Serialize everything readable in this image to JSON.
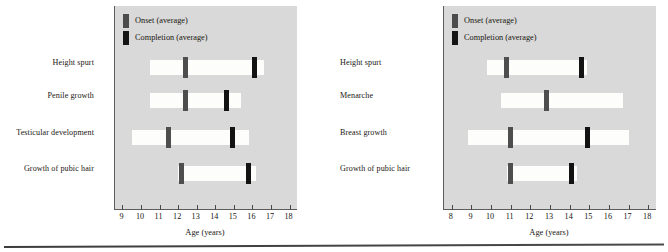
{
  "figure": {
    "bottom_rule": true
  },
  "legend": {
    "onset_label": "Onset (average)",
    "completion_label": "Completion (average)",
    "onset_color": "#4e4e4e",
    "completion_color": "#131313"
  },
  "panels": [
    {
      "id": "male",
      "axis_title": "Age (years)",
      "ticks": [
        9,
        10,
        11,
        12,
        13,
        14,
        15,
        16,
        17,
        18
      ],
      "rows": [
        {
          "label": "Height spurt"
        },
        {
          "label": "Penile growth"
        },
        {
          "label": "Testicular development"
        },
        {
          "label": "Growth of pubic hair"
        }
      ]
    },
    {
      "id": "female",
      "axis_title": "Age (years)",
      "ticks": [
        8,
        9,
        10,
        11,
        12,
        13,
        14,
        15,
        16,
        17,
        18
      ],
      "rows": [
        {
          "label": "Height spurt"
        },
        {
          "label": "Menarche"
        },
        {
          "label": "Breast growth"
        },
        {
          "label": "Growth of pubic hair"
        }
      ]
    }
  ],
  "chart_data": {
    "type": "bar",
    "title": "",
    "xlabel": "Age (years)",
    "ylabel": "",
    "grid": false,
    "legend_position": "top-left",
    "charts": [
      {
        "name": "Male pubertal development",
        "xlim": [
          8.6,
          18.4
        ],
        "xticks": [
          9,
          10,
          11,
          12,
          13,
          14,
          15,
          16,
          17,
          18
        ],
        "categories": [
          "Height spurt",
          "Penile growth",
          "Testicular development",
          "Growth of pubic hair"
        ],
        "ranges": [
          {
            "category": "Height spurt",
            "start": 10.5,
            "end": 16.6,
            "onset": 12.4,
            "completion": 16.1
          },
          {
            "category": "Penile growth",
            "start": 10.5,
            "end": 15.4,
            "onset": 12.4,
            "completion": 14.6
          },
          {
            "category": "Testicular development",
            "start": 9.5,
            "end": 15.8,
            "onset": 11.5,
            "completion": 14.9
          },
          {
            "category": "Growth of pubic hair",
            "start": 12.0,
            "end": 16.2,
            "onset": 12.2,
            "completion": 15.8
          }
        ]
      },
      {
        "name": "Female pubertal development",
        "xlim": [
          7.6,
          18.4
        ],
        "xticks": [
          8,
          9,
          10,
          11,
          12,
          13,
          14,
          15,
          16,
          17,
          18
        ],
        "categories": [
          "Height spurt",
          "Menarche",
          "Breast growth",
          "Growth of pubic hair"
        ],
        "ranges": [
          {
            "category": "Height spurt",
            "start": 9.8,
            "end": 14.9,
            "onset": 10.8,
            "completion": 14.6
          },
          {
            "category": "Menarche",
            "start": 10.5,
            "end": 16.7,
            "onset": 12.8,
            "completion": null
          },
          {
            "category": "Breast growth",
            "start": 8.8,
            "end": 17.0,
            "onset": 11.0,
            "completion": 14.9
          },
          {
            "category": "Growth of pubic hair",
            "start": 10.8,
            "end": 14.4,
            "onset": 11.0,
            "completion": 14.1
          }
        ]
      }
    ]
  }
}
